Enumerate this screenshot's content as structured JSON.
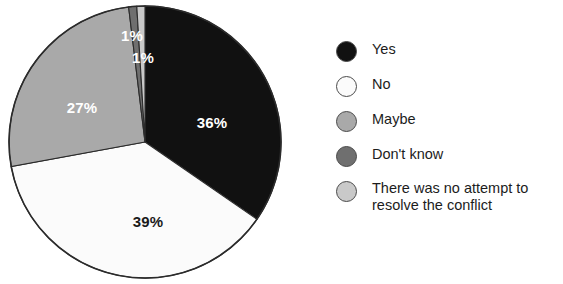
{
  "chart_data": {
    "type": "pie",
    "title": "",
    "subtitle": "",
    "xlabel": "",
    "ylabel": "",
    "legend_position": "right",
    "grid": false,
    "units": "percent",
    "categories": [
      "Yes",
      "No",
      "Maybe",
      "Don't know",
      "There was no attempt to resolve the conflict"
    ],
    "values": [
      36,
      39,
      27,
      1,
      1
    ],
    "data_labels": [
      "36%",
      "39%",
      "27%",
      "1%",
      "1%"
    ],
    "colors": [
      "#111111",
      "#fbfbfb",
      "#a9a9a9",
      "#6f6f6f",
      "#c9c9c9"
    ],
    "slices": [
      {
        "label": "Yes",
        "value": 36,
        "display": "36%",
        "color": "#111111",
        "label_color": "#ffffff",
        "start_angle": 0,
        "end_angle": 129.6
      },
      {
        "label": "No",
        "value": 39,
        "display": "39%",
        "color": "#fbfbfb",
        "label_color": "#1a1a1a",
        "start_angle": 129.6,
        "end_angle": 270.0
      },
      {
        "label": "Maybe",
        "value": 27,
        "display": "27%",
        "color": "#a9a9a9",
        "label_color": "#ffffff",
        "start_angle": 270.0,
        "end_angle": 367.2
      },
      {
        "label": "Don't know",
        "value": 1,
        "display": "1%",
        "color": "#6f6f6f",
        "label_color": "#ffffff",
        "start_angle": 352.8,
        "end_angle": 356.4
      },
      {
        "label": "There was no attempt to resolve the conflict",
        "value": 1,
        "display": "1%",
        "color": "#c9c9c9",
        "label_color": "#ffffff",
        "start_angle": 356.4,
        "end_angle": 360.0
      }
    ]
  },
  "pie": {
    "center_x": 145,
    "center_y": 142,
    "radius": 136,
    "outline_color": "#2b2b2b",
    "labels": {
      "yes": "36%",
      "no": "39%",
      "maybe": "27%",
      "dont_know": "1%",
      "no_attempt": "1%"
    }
  },
  "legend": {
    "items": [
      {
        "label": "Yes",
        "color": "#111111",
        "value": 36
      },
      {
        "label": "No",
        "color": "#fbfbfb",
        "value": 39
      },
      {
        "label": "Maybe",
        "color": "#a9a9a9",
        "value": 27
      },
      {
        "label": "Don't know",
        "color": "#6f6f6f",
        "value": 1
      },
      {
        "label": "There was no attempt to\nresolve the conflict",
        "color": "#c9c9c9",
        "value": 1
      }
    ]
  }
}
